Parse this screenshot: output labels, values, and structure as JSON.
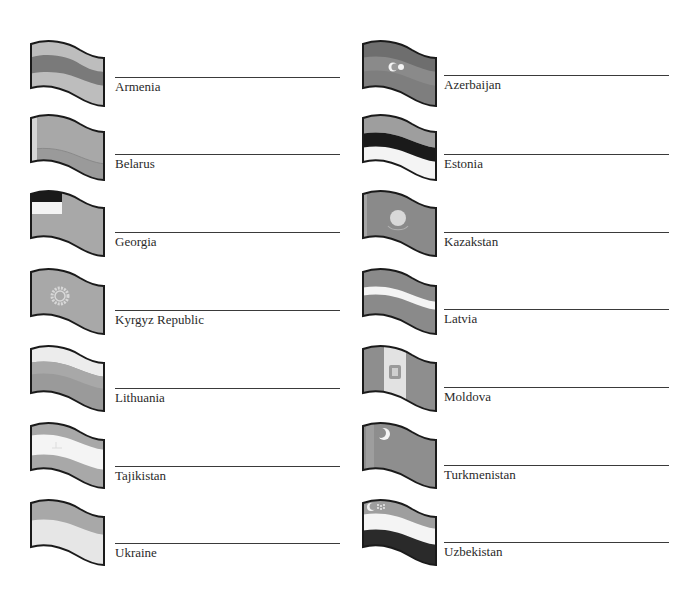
{
  "worksheet": {
    "colors": {
      "ink": "#2a2a2a",
      "light_gray": "#bdbdbd",
      "mid_gray": "#9a9a9a",
      "dark_gray": "#7a7a7a",
      "white": "#f4f4f4",
      "black": "#1a1a1a"
    },
    "entries": [
      {
        "label": "Armenia",
        "flag": "armenia-flag",
        "column": "left",
        "row": 0
      },
      {
        "label": "Azerbaijan",
        "flag": "azerbaijan-flag",
        "column": "right",
        "row": 0
      },
      {
        "label": "Belarus",
        "flag": "belarus-flag",
        "column": "left",
        "row": 1
      },
      {
        "label": "Estonia",
        "flag": "estonia-flag",
        "column": "right",
        "row": 1
      },
      {
        "label": "Georgia",
        "flag": "georgia-flag",
        "column": "left",
        "row": 2
      },
      {
        "label": "Kazakstan",
        "flag": "kazakstan-flag",
        "column": "right",
        "row": 2
      },
      {
        "label": "Kyrgyz Republic",
        "flag": "kyrgyz-republic-flag",
        "column": "left",
        "row": 3
      },
      {
        "label": "Latvia",
        "flag": "latvia-flag",
        "column": "right",
        "row": 3
      },
      {
        "label": "Lithuania",
        "flag": "lithuania-flag",
        "column": "left",
        "row": 4
      },
      {
        "label": "Moldova",
        "flag": "moldova-flag",
        "column": "right",
        "row": 4
      },
      {
        "label": "Tajikistan",
        "flag": "tajikistan-flag",
        "column": "left",
        "row": 5
      },
      {
        "label": "Turkmenistan",
        "flag": "turkmenistan-flag",
        "column": "right",
        "row": 5
      },
      {
        "label": "Ukraine",
        "flag": "ukraine-flag",
        "column": "left",
        "row": 6
      },
      {
        "label": "Uzbekistan",
        "flag": "uzbekistan-flag",
        "column": "right",
        "row": 6
      }
    ]
  }
}
